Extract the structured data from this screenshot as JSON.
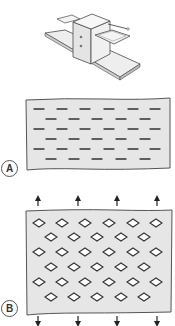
{
  "figure": {
    "machine": {
      "description": "slitting press with feed table and output tray",
      "colors": {
        "outline": "#4a4a4a",
        "fill": "#f2f2f2",
        "shade": "#d9d9d9"
      }
    },
    "panels": [
      {
        "label": "A",
        "state": "slit sheet (unexpanded)",
        "rows": 6,
        "slits_per_row": [
          6,
          5,
          6,
          5,
          6,
          5
        ],
        "fill": "#e6e6e6",
        "outline": "#555555",
        "mark_color": "#333333"
      },
      {
        "label": "B",
        "state": "expanded sheet",
        "rows": 6,
        "openings_per_row": [
          6,
          5,
          6,
          5,
          6,
          5
        ],
        "arrows": {
          "top_count": 4,
          "bottom_count": 4,
          "top_direction": "up",
          "bottom_direction": "down"
        },
        "fill": "#e6e6e6",
        "outline": "#555555",
        "mark_color": "#333333"
      }
    ]
  }
}
